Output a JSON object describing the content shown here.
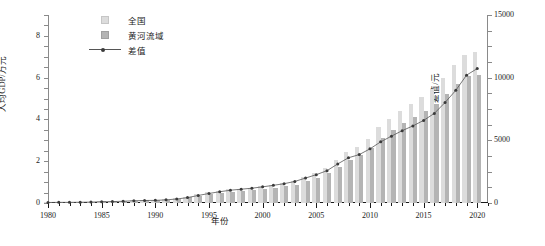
{
  "chart_data": {
    "type": "bar",
    "title": "",
    "xlabel": "年份",
    "ylabel": "人均GDP/万元",
    "y2label": "差值/元",
    "xlim": [
      1980,
      2021
    ],
    "ylim": [
      0,
      9
    ],
    "y2lim": [
      0,
      15000
    ],
    "grid": false,
    "legend_position": "top-left",
    "x_ticks": [
      "1980",
      "1985",
      "1990",
      "1995",
      "2000",
      "2005",
      "2010",
      "2015",
      "2020"
    ],
    "y_ticks": [
      "0",
      "2",
      "4",
      "6",
      "8"
    ],
    "y2_ticks": [
      "0",
      "5000",
      "10000",
      "15000"
    ],
    "categories": [
      1980,
      1981,
      1982,
      1983,
      1984,
      1985,
      1986,
      1987,
      1988,
      1989,
      1990,
      1991,
      1992,
      1993,
      1994,
      1995,
      1996,
      1997,
      1998,
      1999,
      2000,
      2001,
      2002,
      2003,
      2004,
      2005,
      2006,
      2007,
      2008,
      2009,
      2010,
      2011,
      2012,
      2013,
      2014,
      2015,
      2016,
      2017,
      2018,
      2019,
      2020
    ],
    "series": [
      {
        "name": "全国",
        "color": "#dcdcdc",
        "unit": "万元",
        "values": [
          0.047,
          0.05,
          0.053,
          0.058,
          0.069,
          0.086,
          0.096,
          0.112,
          0.137,
          0.153,
          0.168,
          0.193,
          0.236,
          0.311,
          0.418,
          0.51,
          0.585,
          0.647,
          0.693,
          0.738,
          0.8,
          0.872,
          0.95,
          1.058,
          1.236,
          1.447,
          1.682,
          2.054,
          2.441,
          2.671,
          3.082,
          3.623,
          4.023,
          4.395,
          4.755,
          5.067,
          5.446,
          6.001,
          6.585,
          7.081,
          7.212
        ]
      },
      {
        "name": "黄河流域",
        "color": "#b4b4b4",
        "unit": "万元",
        "values": [
          0.043,
          0.045,
          0.048,
          0.052,
          0.062,
          0.076,
          0.085,
          0.098,
          0.119,
          0.133,
          0.147,
          0.168,
          0.204,
          0.268,
          0.358,
          0.434,
          0.495,
          0.545,
          0.583,
          0.62,
          0.671,
          0.731,
          0.796,
          0.886,
          1.037,
          1.221,
          1.424,
          1.742,
          2.08,
          2.285,
          2.65,
          3.135,
          3.49,
          3.818,
          4.14,
          4.408,
          4.731,
          5.199,
          5.686,
          6.061,
          6.139
        ]
      }
    ],
    "diff_series": {
      "name": "差值",
      "color": "#555555",
      "unit": "元",
      "values": [
        40,
        50,
        50,
        60,
        70,
        100,
        110,
        140,
        180,
        200,
        210,
        250,
        320,
        430,
        600,
        760,
        900,
        1020,
        1100,
        1180,
        1290,
        1410,
        1540,
        1720,
        1990,
        2260,
        2580,
        3120,
        3610,
        3860,
        4320,
        4880,
        5330,
        5770,
        6150,
        6590,
        7150,
        8020,
        8990,
        10200,
        10730
      ]
    }
  },
  "legend": {
    "items": [
      {
        "label": "全国",
        "marker": "square-light"
      },
      {
        "label": "黄河流域",
        "marker": "square-dark"
      },
      {
        "label": "差值",
        "marker": "line-dot"
      }
    ]
  }
}
